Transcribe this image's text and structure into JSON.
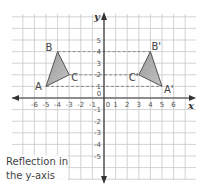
{
  "diagram": {
    "type": "coordinate-grid-reflection",
    "axes": {
      "x_label": "x",
      "y_label": "y",
      "x_ticks": [
        "-6",
        "-5",
        "-4",
        "-3",
        "-2",
        "-1",
        "0",
        "1",
        "2",
        "3",
        "4",
        "5",
        "6"
      ],
      "y_ticks_positive": [
        "1",
        "2",
        "3",
        "4",
        "5"
      ],
      "y_ticks_negative": [
        "-1",
        "-2",
        "-3",
        "-4",
        "-5"
      ],
      "origin_label": "0",
      "x_range": [
        -7.8,
        7.9
      ],
      "y_range": [
        -7.0,
        7.2
      ]
    },
    "original_triangle": {
      "vertices": [
        {
          "label": "A",
          "x": -5,
          "y": 1
        },
        {
          "label": "B",
          "x": -4,
          "y": 4
        },
        {
          "label": "C",
          "x": -3,
          "y": 2
        }
      ]
    },
    "image_triangle": {
      "vertices": [
        {
          "label": "A'",
          "x": 5,
          "y": 1
        },
        {
          "label": "B'",
          "x": 4,
          "y": 4
        },
        {
          "label": "C'",
          "x": 3,
          "y": 2
        }
      ]
    },
    "dashed_links": [
      {
        "y": 4,
        "from_x": -4,
        "to_x": 4
      },
      {
        "y": 2,
        "from_x": -3,
        "to_x": 3
      },
      {
        "y": 1,
        "from_x": -5,
        "to_x": 5
      }
    ],
    "caption_line1": "Reflection in",
    "caption_line2": "the y-axis",
    "colors": {
      "grid": "#c8c8c8",
      "axis": "#333333",
      "triangle_fill": "#a9a9a9",
      "triangle_stroke": "#555555",
      "label": "#444444"
    }
  }
}
